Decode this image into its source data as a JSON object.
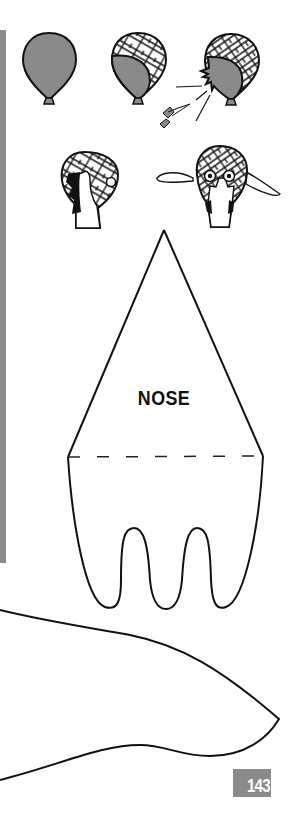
{
  "page": {
    "number": "143",
    "template_label": "NOSE"
  },
  "colors": {
    "balloon_fill": "#8a8a8a",
    "side_bar": "#8c8c8c",
    "page_number_box": "#8a8a8a",
    "ink": "#111111"
  },
  "illustrations": [
    {
      "step": 1,
      "description": "inflated balloon"
    },
    {
      "step": 2,
      "description": "balloon partly covered with paper strips"
    },
    {
      "step": 3,
      "description": "balloon popped with push pin"
    },
    {
      "step": 4,
      "description": "papier-mache head side view with hair"
    },
    {
      "step": 5,
      "description": "papier-mache head front view with ears and face"
    }
  ],
  "templates": [
    {
      "name": "nose",
      "label": "NOSE"
    },
    {
      "name": "ear-or-wing",
      "label": ""
    }
  ]
}
